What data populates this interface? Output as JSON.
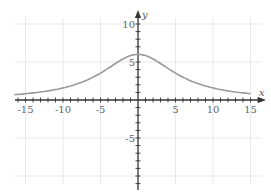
{
  "chart_data": {
    "type": "line",
    "title": "",
    "xlabel": "x",
    "ylabel": "y",
    "xlim": [
      -16.5,
      16.5
    ],
    "ylim": [
      -11,
      11
    ],
    "grid": true,
    "x_ticks": [
      -15,
      -10,
      -5,
      5,
      10,
      15
    ],
    "y_ticks": [
      10,
      5,
      -5
    ],
    "x_tick_labels": [
      "-15",
      "-10",
      "-5",
      "5",
      "10",
      "15"
    ],
    "y_tick_labels": [
      "10",
      "5",
      "-5"
    ],
    "series": [
      {
        "name": "f(x)",
        "color": "#999999",
        "x": [
          -16.5,
          -15,
          -12.5,
          -10,
          -7.5,
          -5,
          -2.5,
          0,
          2.5,
          5,
          7.5,
          10,
          12.5,
          15
        ],
        "values": [
          0.71,
          0.83,
          1.13,
          1.59,
          2.34,
          3.54,
          5.11,
          6.0,
          5.11,
          3.54,
          2.34,
          1.59,
          1.13,
          0.83
        ]
      }
    ]
  }
}
